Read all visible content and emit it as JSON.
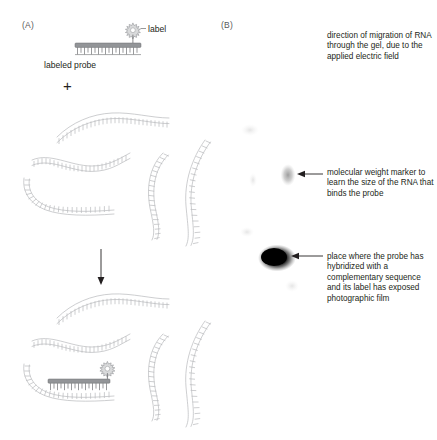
{
  "figure": {
    "panels": [
      {
        "id": "A",
        "letter": "(A)"
      },
      {
        "id": "B",
        "letter": "(B)"
      }
    ]
  },
  "panel_a": {
    "letter": "(A)",
    "label_caption": "label",
    "probe_caption": "labeled probe",
    "plus_sign": "+",
    "icons": {
      "label_star": "star-burst-icon",
      "down_arrow": "downward-arrow-icon"
    },
    "rna_strand_count_top": 5,
    "rna_strand_count_bottom": 5
  },
  "panel_b": {
    "letter": "(B)",
    "notes": {
      "direction": "direction of migration of RNA through the gel, due to the applied electric field",
      "marker": "molecular weight marker to learn the size of the RNA that binds the probe",
      "blob": "place where the probe has hybridized with a complementary sequence and its label has exposed photographic film"
    },
    "bands": [
      {
        "name": "molecular-weight-marker-band",
        "x": 288,
        "y": 175,
        "intensity": "faint"
      },
      {
        "name": "hybridized-probe-band",
        "x": 277,
        "y": 258,
        "intensity": "dark"
      }
    ]
  },
  "colors": {
    "rna_outline": "#b9bbbd",
    "probe_fill": "#939598",
    "probe_outline": "#6d6e71",
    "label_star": "#d9dadb",
    "text": "#231f20",
    "panel_letter": "#58595b",
    "band_dark": "#000000",
    "background": "#ffffff"
  }
}
